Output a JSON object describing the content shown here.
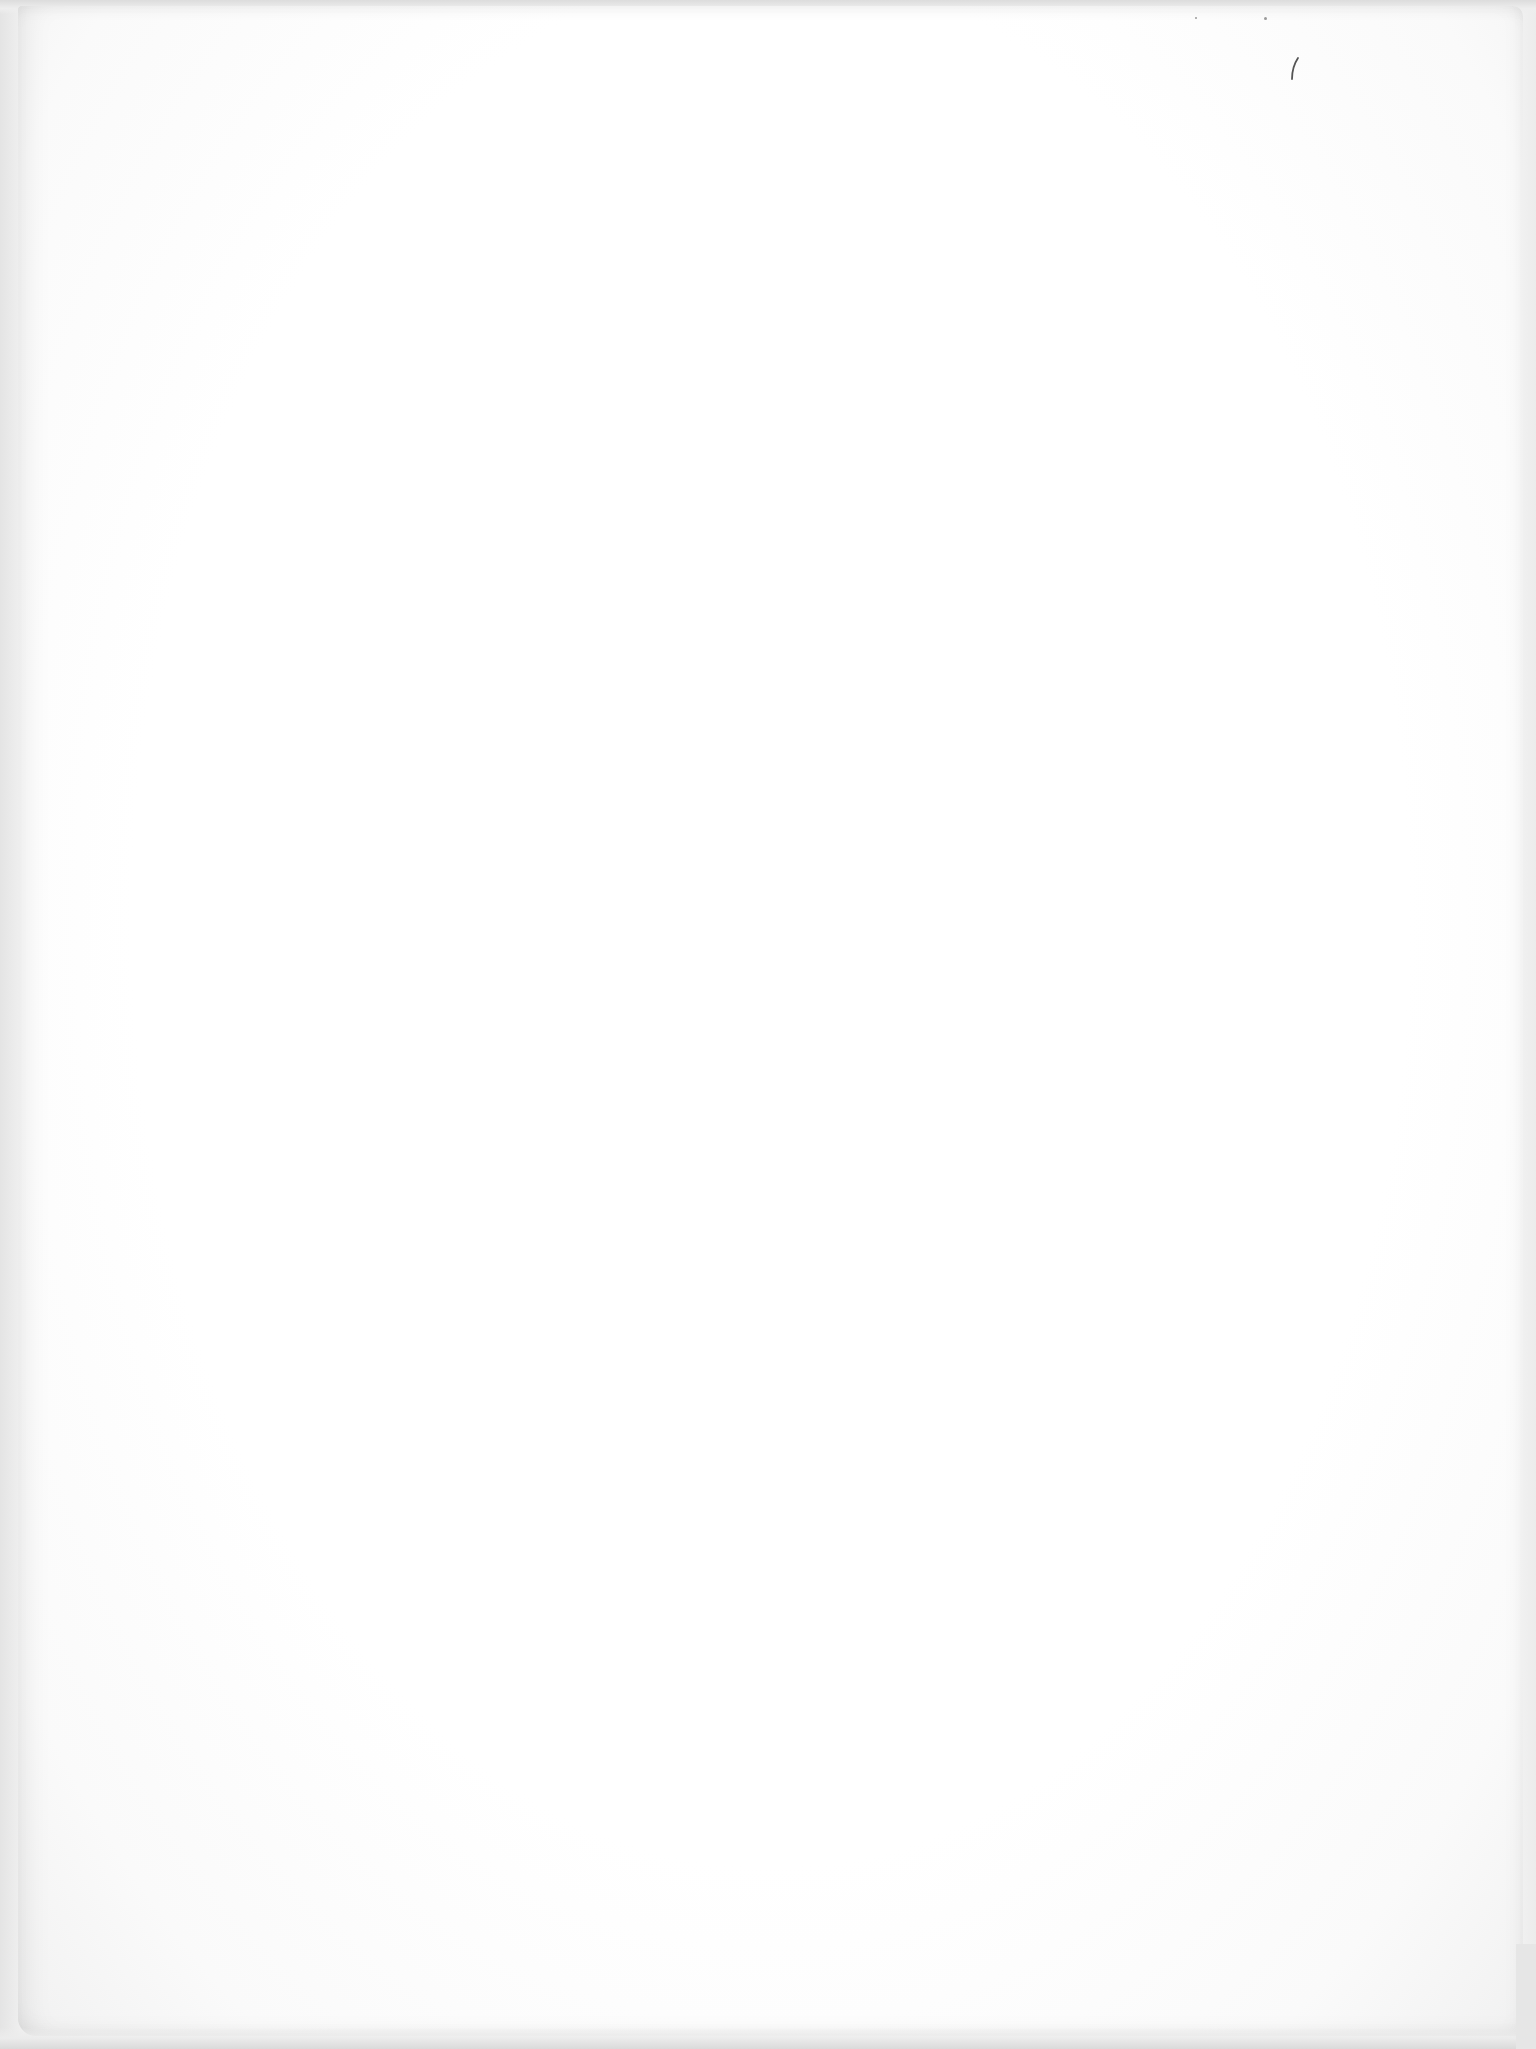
{
  "page": {
    "type": "blank-scanned-page",
    "text_content": "",
    "colors": {
      "paper": "#ffffff",
      "scan_border": "#e4e4e4",
      "mark": "#555555"
    },
    "marks": [
      {
        "name": "pen-tick-mark",
        "x": 1295,
        "y": 65,
        "description": "small curved stroke"
      }
    ]
  }
}
